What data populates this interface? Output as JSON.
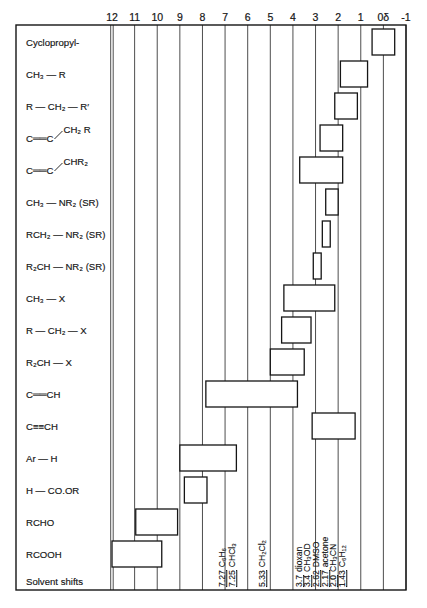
{
  "chart_data": {
    "type": "range-bar",
    "title": "",
    "xlabel": "",
    "x_unit": "δ (ppm)",
    "x_max": 12,
    "x_min": -1,
    "ticks": [
      12,
      11,
      10,
      9,
      8,
      7,
      6,
      5,
      4,
      3,
      2,
      1,
      0,
      -1
    ],
    "tick_labels": [
      "12",
      "11",
      "10",
      "9",
      "8",
      "7",
      "6",
      "5",
      "4",
      "3",
      "2",
      "1",
      "0δ",
      "-1"
    ],
    "grid": true,
    "rows": [
      {
        "label": "Cyclopropyl-",
        "range": [
          0.5,
          -0.5
        ]
      },
      {
        "label": "CH₃ — R",
        "range": [
          1.9,
          0.7
        ]
      },
      {
        "label": "R — CH₂ — R′",
        "range": [
          2.15,
          1.15
        ]
      },
      {
        "label": "C══C",
        "branch": "CH₂ R",
        "range": [
          2.8,
          1.8
        ]
      },
      {
        "label": "C══C",
        "branch": "CHR₂",
        "range": [
          3.7,
          1.8
        ]
      },
      {
        "label": "CH₃ — NR₂  (SR)",
        "range": [
          2.55,
          2.0
        ]
      },
      {
        "label": "RCH₂ — NR₂  (SR)",
        "range": [
          2.7,
          2.35
        ]
      },
      {
        "label": "R₂CH — NR₂  (SR)",
        "range": [
          3.1,
          2.75
        ]
      },
      {
        "label": "CH₃ — X",
        "range": [
          4.4,
          2.15
        ]
      },
      {
        "label": "R — CH₂ — X",
        "range": [
          4.5,
          3.2
        ]
      },
      {
        "label": "R₂CH — X",
        "range": [
          5.0,
          3.5
        ]
      },
      {
        "label": "C══CH",
        "range": [
          7.85,
          3.8
        ]
      },
      {
        "label": "C≡≡CH",
        "range": [
          3.15,
          1.25
        ]
      },
      {
        "label": "Ar — H",
        "range": [
          9.0,
          6.5
        ]
      },
      {
        "label": "H — CO.OR",
        "range": [
          8.8,
          7.8
        ]
      },
      {
        "label": "RCHO",
        "range": [
          10.95,
          9.1
        ]
      },
      {
        "label": "RCOOH",
        "range": [
          12.0,
          9.8
        ]
      }
    ],
    "solvent_row_label": "Solvent shifts",
    "solvent_shifts": [
      {
        "value": "7.27",
        "name": "C₆H₆"
      },
      {
        "value": "7.25",
        "name": "CHCl₃"
      },
      {
        "value": "5.33",
        "name": "CH₂Cl₂"
      },
      {
        "value": "3.7",
        "name": "dioxan"
      },
      {
        "value": "3.4",
        "name": "CH₃OD"
      },
      {
        "value": "2.62",
        "name": "DMSO"
      },
      {
        "value": "2.17",
        "name": "acetone"
      },
      {
        "value": "2.0",
        "name": "CH₃CN"
      },
      {
        "value": "1.43",
        "name": "C₆H₁₂"
      }
    ],
    "layout": {
      "frame": {
        "left": 16,
        "top": 25,
        "right": 406,
        "bottom": 590
      },
      "x_at_max": 112,
      "x_at_min": 406,
      "row_top": 29,
      "row_step": 32,
      "box_height": 26,
      "label_x": 26,
      "solvent_label_centers": [
        222,
        232,
        262,
        299,
        307,
        316,
        325,
        333,
        342
      ]
    }
  }
}
